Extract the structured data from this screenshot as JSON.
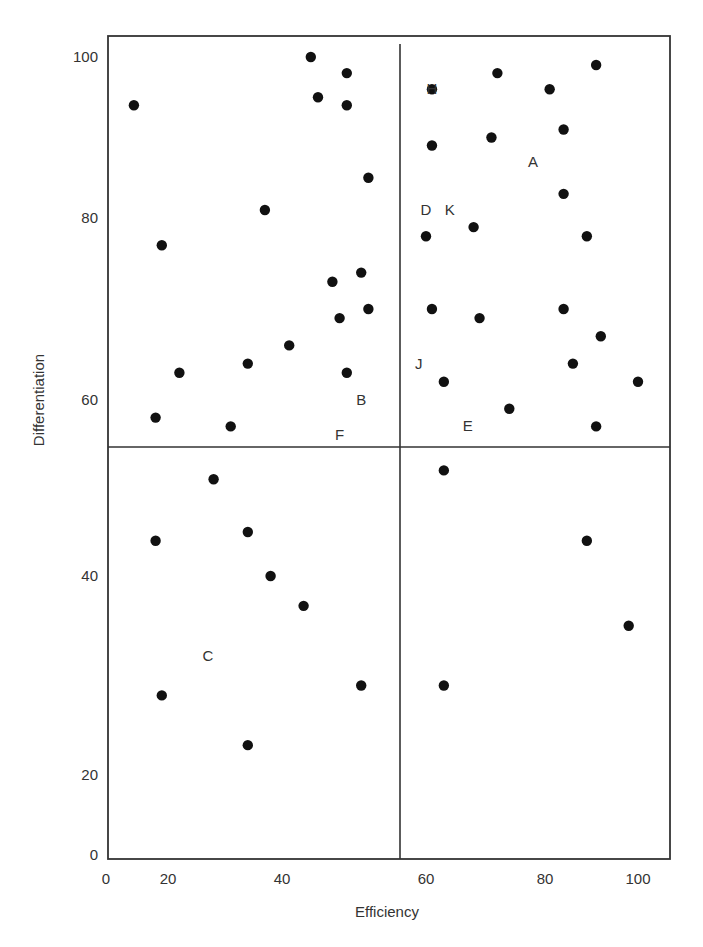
{
  "chart_data": {
    "type": "scatter",
    "title": "",
    "xlabel": "Efficiency",
    "ylabel": "Differentiation",
    "xlim": [
      0,
      100
    ],
    "ylim": [
      0,
      100
    ],
    "x_ticks": [
      0,
      20,
      40,
      60,
      80,
      100
    ],
    "y_ticks": [
      0,
      20,
      40,
      60,
      80,
      100
    ],
    "grid": false,
    "legend": null,
    "quadrant_dividers": {
      "x": 57,
      "y": 55
    },
    "points": [
      {
        "x": 9,
        "y": 94
      },
      {
        "x": 44,
        "y": 100
      },
      {
        "x": 49,
        "y": 98
      },
      {
        "x": 45,
        "y": 95
      },
      {
        "x": 49,
        "y": 94
      },
      {
        "x": 52,
        "y": 85
      },
      {
        "x": 37,
        "y": 81
      },
      {
        "x": 18,
        "y": 77
      },
      {
        "x": 47,
        "y": 73
      },
      {
        "x": 51,
        "y": 74
      },
      {
        "x": 48,
        "y": 69
      },
      {
        "x": 52,
        "y": 70
      },
      {
        "x": 41,
        "y": 66
      },
      {
        "x": 34,
        "y": 64
      },
      {
        "x": 22,
        "y": 63
      },
      {
        "x": 49,
        "y": 63
      },
      {
        "x": 16,
        "y": 58
      },
      {
        "x": 31,
        "y": 57
      },
      {
        "x": 61,
        "y": 96
      },
      {
        "x": 72,
        "y": 98
      },
      {
        "x": 81,
        "y": 96
      },
      {
        "x": 91,
        "y": 99
      },
      {
        "x": 61,
        "y": 89
      },
      {
        "x": 71,
        "y": 90
      },
      {
        "x": 84,
        "y": 91
      },
      {
        "x": 84,
        "y": 83
      },
      {
        "x": 60,
        "y": 78
      },
      {
        "x": 68,
        "y": 79
      },
      {
        "x": 89,
        "y": 78
      },
      {
        "x": 61,
        "y": 70
      },
      {
        "x": 69,
        "y": 69
      },
      {
        "x": 84,
        "y": 70
      },
      {
        "x": 92,
        "y": 67
      },
      {
        "x": 63,
        "y": 62
      },
      {
        "x": 86,
        "y": 64
      },
      {
        "x": 100,
        "y": 62
      },
      {
        "x": 74,
        "y": 59
      },
      {
        "x": 91,
        "y": 57
      },
      {
        "x": 28,
        "y": 51
      },
      {
        "x": 16,
        "y": 44
      },
      {
        "x": 34,
        "y": 45
      },
      {
        "x": 38,
        "y": 40
      },
      {
        "x": 43,
        "y": 37
      },
      {
        "x": 18,
        "y": 28
      },
      {
        "x": 51,
        "y": 29
      },
      {
        "x": 34,
        "y": 23
      },
      {
        "x": 63,
        "y": 52
      },
      {
        "x": 89,
        "y": 44
      },
      {
        "x": 98,
        "y": 35
      },
      {
        "x": 63,
        "y": 29
      }
    ],
    "annotations": [
      {
        "text": "H",
        "x": 61,
        "y": 96
      },
      {
        "text": "A",
        "x": 78,
        "y": 87
      },
      {
        "text": "D",
        "x": 60,
        "y": 81
      },
      {
        "text": "K",
        "x": 64,
        "y": 81
      },
      {
        "text": "J",
        "x": 59,
        "y": 64
      },
      {
        "text": "E",
        "x": 67,
        "y": 57
      },
      {
        "text": "B",
        "x": 51,
        "y": 60
      },
      {
        "text": "F",
        "x": 48,
        "y": 56
      },
      {
        "text": "C",
        "x": 27,
        "y": 32
      }
    ]
  },
  "axes": {
    "x_title": "Efficiency",
    "y_title": "Differentiation",
    "x_tick_labels": [
      "0",
      "20",
      "40",
      "60",
      "80",
      "100"
    ],
    "y_tick_labels": [
      "0",
      "20",
      "40",
      "60",
      "80",
      "100"
    ]
  }
}
